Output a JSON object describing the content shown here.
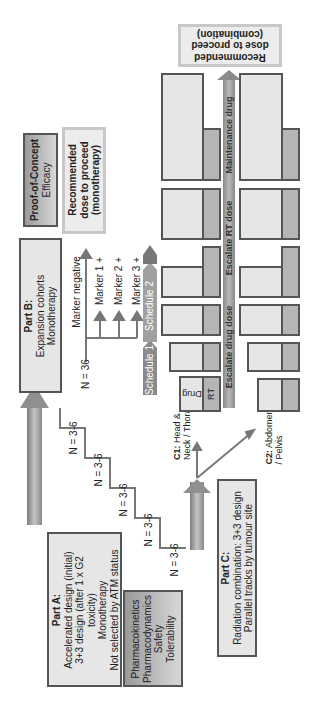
{
  "part_a": {
    "title": "Part A:",
    "lines": [
      "Accelerated design (initial)",
      "3+3 design (after 1 x G2",
      "toxicity)",
      "Monotherapy",
      "Not selected by ATM status"
    ]
  },
  "part_a_endpoints": {
    "lines": [
      "Pharmacokinetics",
      "Pharmacodynamics",
      "Safety",
      "Tolerability"
    ]
  },
  "part_b": {
    "title": "Part B:",
    "lines": [
      "Expansion cohorts",
      "Monotherapy"
    ]
  },
  "part_c": {
    "title": "Part C:",
    "lines": [
      "Radiation combination: 3+3 design",
      "Parallel tracks by tumour site"
    ]
  },
  "proof_of_concept": {
    "title": "Proof-of-Concept",
    "subtitle": "Efficacy"
  },
  "recommended_mono": {
    "lines": [
      "Recommended",
      "dose to proceed",
      "(monotherapy)"
    ]
  },
  "recommended_combo": {
    "lines": [
      "Recommended",
      "dose to proceed",
      "(combination)"
    ]
  },
  "staircase": {
    "labels": [
      "N = 3-6",
      "N = 3-6",
      "N = 3-6",
      "N = 3-6",
      "N = 3-6"
    ]
  },
  "expansion": {
    "n_label": "N = 36",
    "markers": [
      "Marker negative",
      "Marker 1 +",
      "Marker 2 +",
      "Marker 3 +"
    ]
  },
  "schedules": [
    "Schedule 1",
    "Schedule 2"
  ],
  "tracks": {
    "c1": {
      "title": "C1:",
      "text": "Head &",
      "text2": "Neck / Thorax"
    },
    "c2": {
      "title": "C2:",
      "text": "Abdomen",
      "text2": "/ Pelvis"
    }
  },
  "combo_axis": {
    "segments": [
      "Escalate drug dose",
      "Escalate RT dose",
      "Maintenance drug"
    ]
  },
  "legend_block": {
    "drug": "Drug",
    "rt": "RT"
  },
  "colors": {
    "box_fill": "#e6e6e6",
    "box_border": "#555555",
    "rt_fill": "#b5b5b5",
    "arrow_fill": "#9a9a9a",
    "pale_border": "#c8c8c8"
  }
}
